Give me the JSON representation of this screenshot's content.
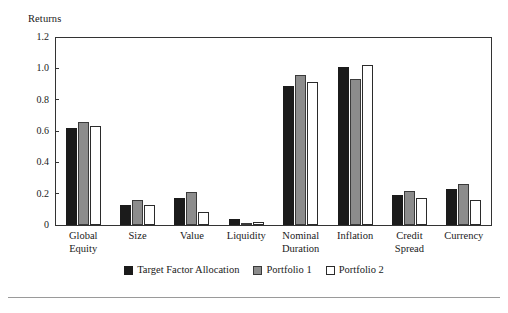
{
  "chart_data": {
    "type": "bar",
    "title": "",
    "ylabel": "Returns",
    "xlabel": "",
    "ylim": [
      0,
      1.2
    ],
    "yticks": [
      "0",
      "0.2",
      "0.4",
      "0.6",
      "0.8",
      "1.0",
      "1.2"
    ],
    "ytick_values": [
      0,
      0.2,
      0.4,
      0.6,
      0.8,
      1.0,
      1.2
    ],
    "grid": false,
    "legend_position": "bottom-center",
    "categories": [
      "Global\nEquity",
      "Size",
      "Value",
      "Liquidity",
      "Nominal\nDuration",
      "Inflation",
      "Credit\nSpread",
      "Currency"
    ],
    "series": [
      {
        "name": "Target Factor Allocation",
        "color": "#1b1b1b",
        "values": [
          0.62,
          0.13,
          0.17,
          0.04,
          0.89,
          1.01,
          0.19,
          0.23
        ]
      },
      {
        "name": "Portfolio 1",
        "color": "#8c8c8c",
        "values": [
          0.66,
          0.16,
          0.21,
          0.0,
          0.96,
          0.93,
          0.22,
          0.26
        ]
      },
      {
        "name": "Portfolio 2",
        "color": "#ffffff",
        "values": [
          0.63,
          0.13,
          0.08,
          0.02,
          0.91,
          1.02,
          0.17,
          0.16
        ]
      }
    ]
  }
}
